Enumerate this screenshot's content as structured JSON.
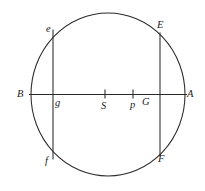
{
  "figure": {
    "type": "geometric-diagram",
    "background_color": "#ffffff",
    "stroke_color": "#2a2a2a",
    "canvas": {
      "width": 205,
      "height": 191
    }
  },
  "circle": {
    "center_x": 108,
    "center_y": 94.5,
    "radius_x": 77,
    "radius_y": 81.5
  },
  "diameter": {
    "name": "horizontal-diameter",
    "y": 94.5,
    "x_start": 29,
    "x_end": 187
  },
  "chords": [
    {
      "name": "left-vertical-chord",
      "x": 53,
      "y_top": 29.5,
      "y_bottom": 159.5,
      "top_label": "e",
      "bottom_label": "f",
      "intersection_label": "g"
    },
    {
      "name": "right-vertical-chord",
      "x": 160,
      "y_top": 32.5,
      "y_bottom": 156.5,
      "top_label": "E",
      "bottom_label": "F",
      "intersection_label": "G"
    }
  ],
  "ticks": [
    {
      "name": "tick-S",
      "x": 105,
      "label": "S"
    },
    {
      "name": "tick-p",
      "x": 133,
      "label": "p"
    }
  ],
  "labels": {
    "B": {
      "text": "B",
      "x": 17,
      "y": 89
    },
    "A": {
      "text": "A",
      "x": 187,
      "y": 89
    },
    "e": {
      "text": "e",
      "x": 46,
      "y": 24
    },
    "E": {
      "text": "E",
      "x": 157,
      "y": 20
    },
    "f": {
      "text": "f",
      "x": 45,
      "y": 156
    },
    "F": {
      "text": "F",
      "x": 158,
      "y": 154
    },
    "g": {
      "text": "g",
      "x": 55,
      "y": 98
    },
    "G": {
      "text": "G",
      "x": 142,
      "y": 97
    },
    "S": {
      "text": "S",
      "x": 101,
      "y": 101
    },
    "p": {
      "text": "p",
      "x": 130,
      "y": 100
    }
  }
}
